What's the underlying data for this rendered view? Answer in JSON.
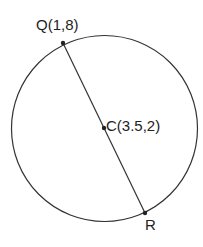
{
  "diagram": {
    "circle": {
      "center_label": "C(3.5,2)"
    },
    "points": {
      "Q": {
        "label": "Q(1,8)"
      },
      "C": {
        "label": "C(3.5,2)"
      },
      "R": {
        "label": "R"
      }
    },
    "colors": {
      "stroke": "#333333",
      "text": "#222222",
      "background": "#ffffff"
    }
  }
}
